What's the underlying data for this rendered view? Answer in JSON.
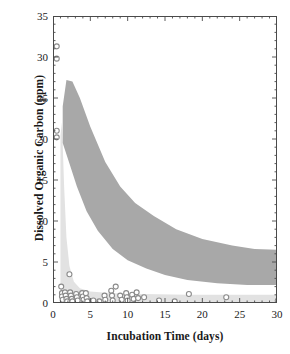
{
  "chart_data": {
    "type": "scatter",
    "title": "",
    "xlabel": "Incubation Time (days)",
    "ylabel": "Dissolved Organic Carbon (ppm)",
    "xlim": [
      0,
      30
    ],
    "ylim": [
      0,
      35
    ],
    "xticks": [
      0,
      5,
      10,
      15,
      20,
      25,
      30
    ],
    "yticks": [
      0,
      5,
      10,
      15,
      20,
      25,
      30,
      35
    ],
    "xtick_labels": [
      "0",
      "5",
      "10",
      "15",
      "20",
      "25",
      "30"
    ],
    "ytick_labels": [
      "0",
      "5",
      "10",
      "15",
      "20",
      "25",
      "30",
      "35"
    ],
    "grid": false,
    "legend": "none",
    "minor_ticks": true,
    "frame": "box",
    "colors": {
      "filled_marker": "#4d4d4d",
      "open_marker": "#8a8a8a",
      "upper_band": "#a8a8a8",
      "lower_band": "#e2e2e2",
      "axis": "#4a4a4a",
      "text": "#1a1a1a",
      "background": "#ffffff"
    },
    "series": [
      {
        "name": "Dissolved organic carbon (filled diamonds)",
        "marker": "filled-diamond",
        "color": "#4d4d4d",
        "points": [
          [
            0.5,
            27.4
          ],
          [
            0.6,
            25.6
          ],
          [
            0.6,
            24.9
          ],
          [
            0.6,
            24.1
          ],
          [
            0.6,
            23.4
          ],
          [
            0.6,
            22.6
          ],
          [
            0.5,
            21.0
          ],
          [
            0.5,
            20.3
          ],
          [
            1.1,
            26.0
          ],
          [
            1.1,
            25.3
          ],
          [
            1.1,
            24.5
          ],
          [
            1.1,
            23.8
          ],
          [
            1.1,
            23.0
          ],
          [
            1.5,
            27.7
          ],
          [
            1.6,
            25.8
          ],
          [
            1.6,
            25.1
          ],
          [
            1.6,
            24.3
          ],
          [
            1.6,
            23.6
          ],
          [
            2.0,
            24.9
          ],
          [
            2.1,
            24.2
          ],
          [
            2.2,
            22.3
          ],
          [
            2.3,
            21.6
          ],
          [
            2.2,
            20.0
          ],
          [
            2.3,
            19.5
          ],
          [
            2.2,
            16.7
          ],
          [
            3.2,
            21.2
          ],
          [
            3.3,
            20.4
          ],
          [
            3.4,
            19.9
          ],
          [
            3.6,
            17.6
          ],
          [
            3.5,
            16.4
          ],
          [
            4.3,
            20.5
          ],
          [
            4.4,
            19.8
          ],
          [
            4.4,
            17.6
          ],
          [
            4.5,
            13.3
          ],
          [
            4.6,
            12.9
          ],
          [
            4.9,
            27.2
          ],
          [
            6.4,
            14.5
          ],
          [
            6.6,
            14.2
          ],
          [
            6.7,
            13.6
          ],
          [
            6.9,
            11.0
          ],
          [
            7.1,
            10.8
          ],
          [
            8.0,
            13.9
          ],
          [
            8.2,
            13.6
          ],
          [
            8.3,
            8.6
          ],
          [
            8.4,
            8.2
          ],
          [
            8.3,
            6.0
          ],
          [
            9.4,
            12.4
          ],
          [
            9.6,
            11.1
          ],
          [
            9.7,
            10.8
          ],
          [
            9.6,
            8.8
          ],
          [
            9.8,
            7.8
          ],
          [
            9.7,
            7.3
          ],
          [
            10.5,
            11.5
          ],
          [
            10.7,
            11.2
          ],
          [
            10.8,
            8.2
          ],
          [
            11.3,
            11.6
          ],
          [
            11.5,
            10.6
          ],
          [
            11.4,
            6.0
          ],
          [
            14.2,
            13.1
          ],
          [
            14.3,
            10.6
          ],
          [
            14.2,
            8.8
          ],
          [
            14.4,
            8.6
          ],
          [
            14.3,
            6.4
          ],
          [
            14.5,
            5.9
          ],
          [
            14.4,
            4.6
          ],
          [
            16.3,
            4.7
          ],
          [
            16.4,
            2.0
          ],
          [
            17.4,
            10.3
          ],
          [
            17.3,
            7.4
          ],
          [
            17.5,
            6.9
          ],
          [
            17.4,
            5.1
          ],
          [
            17.9,
            5.7
          ],
          [
            22.3,
            6.6
          ],
          [
            22.5,
            6.2
          ],
          [
            22.4,
            2.5
          ],
          [
            22.6,
            2.4
          ],
          [
            23.3,
            5.6
          ],
          [
            23.4,
            2.6
          ],
          [
            23.7,
            2.5
          ],
          [
            26.2,
            7.0
          ],
          [
            30.1,
            3.8
          ],
          [
            30.2,
            3.6
          ],
          [
            30.1,
            2.6
          ]
        ]
      },
      {
        "name": "Control / blank (open circles)",
        "marker": "open-circle",
        "color": "#8a8a8a",
        "points": [
          [
            0.5,
            31.3
          ],
          [
            0.5,
            29.8
          ],
          [
            0.5,
            21.0
          ],
          [
            0.5,
            20.2
          ],
          [
            1.1,
            2.0
          ],
          [
            1.2,
            1.2
          ],
          [
            1.2,
            0.8
          ],
          [
            1.3,
            0.4
          ],
          [
            1.6,
            1.3
          ],
          [
            1.7,
            0.9
          ],
          [
            1.8,
            0.5
          ],
          [
            1.9,
            0.2
          ],
          [
            2.2,
            3.5
          ],
          [
            2.3,
            1.3
          ],
          [
            2.4,
            0.9
          ],
          [
            2.5,
            0.5
          ],
          [
            2.6,
            0.2
          ],
          [
            3.1,
            1.1
          ],
          [
            3.2,
            0.7
          ],
          [
            3.3,
            0.3
          ],
          [
            3.9,
            1.2
          ],
          [
            4.0,
            0.8
          ],
          [
            4.1,
            0.4
          ],
          [
            4.4,
            1.2
          ],
          [
            4.5,
            0.6
          ],
          [
            4.6,
            0.2
          ],
          [
            5.4,
            0.3
          ],
          [
            6.2,
            0.2
          ],
          [
            6.9,
            0.9
          ],
          [
            7.0,
            0.4
          ],
          [
            7.8,
            1.5
          ],
          [
            7.9,
            0.9
          ],
          [
            8.0,
            0.3
          ],
          [
            8.4,
            2.0
          ],
          [
            9.0,
            0.9
          ],
          [
            9.2,
            0.4
          ],
          [
            9.8,
            1.2
          ],
          [
            9.9,
            0.7
          ],
          [
            10.0,
            0.3
          ],
          [
            10.6,
            1.0
          ],
          [
            10.8,
            0.5
          ],
          [
            11.2,
            1.3
          ],
          [
            11.4,
            0.6
          ],
          [
            12.2,
            0.7
          ],
          [
            14.2,
            0.3
          ],
          [
            16.3,
            0.2
          ],
          [
            18.2,
            1.1
          ],
          [
            23.2,
            0.7
          ],
          [
            30.1,
            0.3
          ]
        ]
      }
    ],
    "bands": [
      {
        "name": "upper-envelope-band",
        "description": "Dark gray exponential-decay envelope enclosing the filled-diamond data",
        "color": "#a8a8a8",
        "upper_bound": [
          [
            1.3,
            24.0
          ],
          [
            1.8,
            27.2
          ],
          [
            2.6,
            27.0
          ],
          [
            3.6,
            25.0
          ],
          [
            5.0,
            21.5
          ],
          [
            7.0,
            17.2
          ],
          [
            9.0,
            14.2
          ],
          [
            11.0,
            12.2
          ],
          [
            13.5,
            10.6
          ],
          [
            16.5,
            9.0
          ],
          [
            20.0,
            7.8
          ],
          [
            24.0,
            7.0
          ],
          [
            27.0,
            6.6
          ],
          [
            30.0,
            6.5
          ]
        ],
        "lower_bound": [
          [
            1.3,
            19.5
          ],
          [
            2.2,
            17.0
          ],
          [
            3.2,
            14.2
          ],
          [
            4.5,
            11.2
          ],
          [
            6.0,
            8.8
          ],
          [
            8.0,
            6.6
          ],
          [
            10.0,
            5.2
          ],
          [
            12.5,
            4.2
          ],
          [
            15.0,
            3.4
          ],
          [
            18.0,
            2.8
          ],
          [
            22.0,
            2.4
          ],
          [
            26.0,
            2.2
          ],
          [
            30.0,
            2.2
          ]
        ]
      },
      {
        "name": "lower-envelope-band",
        "description": "Pale gray envelope for the open-circle control series",
        "color": "#e2e2e2",
        "upper_bound": [
          [
            1.0,
            20.5
          ],
          [
            1.2,
            22.0
          ],
          [
            1.5,
            14.0
          ],
          [
            1.8,
            8.0
          ],
          [
            2.2,
            4.5
          ],
          [
            2.8,
            2.6
          ],
          [
            3.6,
            1.8
          ],
          [
            5.0,
            1.4
          ],
          [
            8.0,
            1.2
          ],
          [
            12.0,
            1.1
          ],
          [
            18.0,
            1.0
          ],
          [
            24.0,
            1.0
          ],
          [
            30.0,
            1.0
          ]
        ],
        "lower_bound": [
          [
            1.0,
            0.0
          ],
          [
            30.0,
            0.0
          ]
        ]
      }
    ]
  },
  "caption_sliver": ""
}
